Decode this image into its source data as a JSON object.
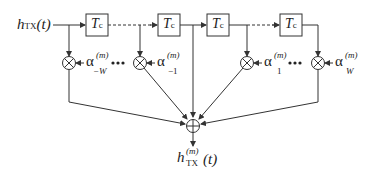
{
  "diagram": {
    "type": "tapped-delay-line filter (FIR)",
    "input_label": {
      "main": "h",
      "sub": "TX",
      "arg": "(t)"
    },
    "output_label": {
      "main": "h",
      "sup": "(m)",
      "sub": "TX",
      "arg": "(t)"
    },
    "delay_blocks": [
      {
        "label": "T",
        "sub": "c"
      },
      {
        "label": "T",
        "sub": "c"
      },
      {
        "label": "T",
        "sub": "c"
      },
      {
        "label": "T",
        "sub": "c"
      }
    ],
    "coefficients": [
      {
        "symbol": "α",
        "sup": "(m)",
        "sub": "−W"
      },
      {
        "symbol": "α",
        "sup": "(m)",
        "sub": "−1"
      },
      {
        "symbol": "α",
        "sup": "(m)",
        "sub": "1"
      },
      {
        "symbol": "α",
        "sup": "(m)",
        "sub": "W"
      }
    ],
    "ellipsis": "•••",
    "multiplier_symbol": "⊗",
    "adder_symbol": "⊕",
    "colors": {
      "stroke": "#333333",
      "background": "#ffffff"
    }
  }
}
